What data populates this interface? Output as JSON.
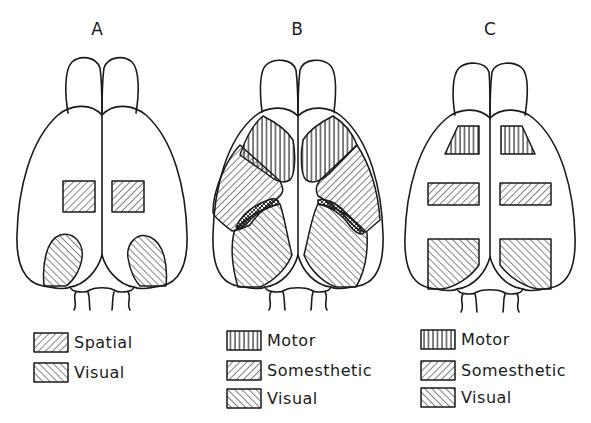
{
  "figure": {
    "panels": [
      {
        "id": "A",
        "label": "A",
        "legend": [
          {
            "pattern": "spatial-hatch",
            "label": "Spatial"
          },
          {
            "pattern": "visual-hatch",
            "label": "Visual"
          }
        ]
      },
      {
        "id": "B",
        "label": "B",
        "legend": [
          {
            "pattern": "motor-hatch",
            "label": "Motor"
          },
          {
            "pattern": "somesthetic-hatch",
            "label": "Somesthetic"
          },
          {
            "pattern": "visual-hatch",
            "label": "Visual"
          }
        ]
      },
      {
        "id": "C",
        "label": "C",
        "legend": [
          {
            "pattern": "motor-hatch",
            "label": "Motor"
          },
          {
            "pattern": "somesthetic-hatch",
            "label": "Somesthetic"
          },
          {
            "pattern": "visual-hatch",
            "label": "Visual"
          }
        ]
      }
    ],
    "colors": {
      "ink": "#1a1a1a",
      "background": "#ffffff"
    }
  }
}
